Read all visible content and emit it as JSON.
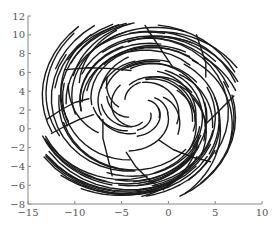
{
  "chart_data": {
    "type": "line",
    "title": "",
    "xlabel": "",
    "ylabel": "",
    "xlim": [
      -15,
      10
    ],
    "ylim": [
      -8,
      12
    ],
    "xticks": [
      -15,
      -10,
      -5,
      0,
      5,
      10
    ],
    "xtick_labels": [
      "−15",
      "−10",
      "−5",
      "0",
      "5",
      "10"
    ],
    "yticks": [
      -8,
      -6,
      -4,
      -2,
      0,
      2,
      4,
      6,
      8,
      10,
      12
    ],
    "ytick_labels": [
      "−8",
      "−6",
      "−4",
      "−2",
      "0",
      "2",
      "4",
      "6",
      "8",
      "10",
      "12"
    ],
    "grid": false,
    "legend": null,
    "line_color": "#1a1a1a",
    "spiral": {
      "center": [
        -3.0,
        2.2
      ],
      "num_strands": 90,
      "r_min": 1.2,
      "r_max": 9.8,
      "x_scale": 1.05,
      "y_scale": 0.92,
      "arc_length_rad": 1.5,
      "outward_drift": 2.4
    },
    "series": [
      {
        "name": "strand-upper-left",
        "points": [
          [
            -11,
            6.3
          ],
          [
            -8.5,
            6.5
          ],
          [
            -6,
            6.4
          ],
          [
            -4,
            6.2
          ]
        ]
      },
      {
        "name": "strand-top",
        "points": [
          [
            -2.5,
            11
          ],
          [
            -1.5,
            9.5
          ],
          [
            -0.5,
            8
          ],
          [
            0.5,
            6.5
          ]
        ]
      },
      {
        "name": "strand-top-right",
        "points": [
          [
            3,
            10
          ],
          [
            3.5,
            8.5
          ],
          [
            4,
            7
          ],
          [
            4,
            5.5
          ]
        ]
      },
      {
        "name": "strand-right",
        "points": [
          [
            7,
            3.5
          ],
          [
            6,
            2.5
          ],
          [
            5,
            1.5
          ],
          [
            4,
            0.5
          ]
        ]
      },
      {
        "name": "strand-lower-right",
        "points": [
          [
            4.5,
            -3.5
          ],
          [
            2.5,
            -3
          ],
          [
            0.5,
            -2.2
          ],
          [
            -1,
            -1.2
          ]
        ]
      },
      {
        "name": "strand-bottom",
        "points": [
          [
            -0.5,
            -6.5
          ],
          [
            -2,
            -5.5
          ],
          [
            -3.5,
            -4
          ],
          [
            -4.5,
            -2.5
          ]
        ]
      },
      {
        "name": "strand-lower-left",
        "points": [
          [
            -6,
            -5
          ],
          [
            -6.5,
            -3
          ],
          [
            -7,
            -1
          ],
          [
            -7,
            1
          ]
        ]
      },
      {
        "name": "strand-left",
        "points": [
          [
            -13,
            1
          ],
          [
            -11.5,
            2
          ],
          [
            -10,
            2.8
          ],
          [
            -8.5,
            3.2
          ]
        ]
      },
      {
        "name": "strand-left-2",
        "points": [
          [
            -12.5,
            -0.5
          ],
          [
            -11,
            0.3
          ],
          [
            -9.5,
            1
          ],
          [
            -8,
            1.5
          ]
        ]
      }
    ]
  }
}
